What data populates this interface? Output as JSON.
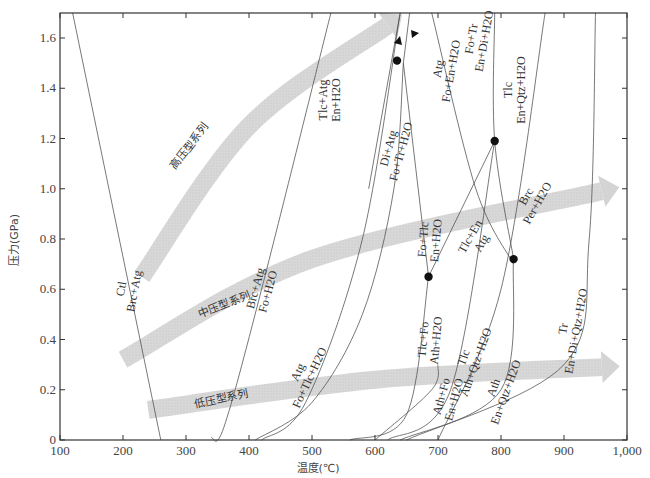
{
  "chart_data": {
    "type": "line",
    "title": "",
    "xlabel": "温度(℃)",
    "ylabel": "压力(GPa)",
    "xlim": [
      100,
      1000
    ],
    "ylim": [
      0,
      1.7
    ],
    "grid": false,
    "x_ticks": [
      100,
      200,
      300,
      400,
      500,
      600,
      700,
      800,
      900,
      1000
    ],
    "x_tick_labels": [
      "100",
      "200",
      "300",
      "400",
      "500",
      "600",
      "700",
      "800",
      "900",
      "1,000"
    ],
    "y_ticks": [
      0,
      0.2,
      0.4,
      0.6,
      0.8,
      1.0,
      1.2,
      1.4,
      1.6
    ],
    "y_tick_labels": [
      "0",
      "0.2",
      "0.4",
      "0.6",
      "0.8",
      "1.0",
      "1.2",
      "1.4",
      "1.6"
    ],
    "reactions": [
      {
        "upper": "Ctl",
        "lower": "Brc+Atg",
        "points": [
          [
            120,
            1.7
          ],
          [
            260,
            0
          ]
        ]
      },
      {
        "upper": "Brc+Atg",
        "lower": "Fo+H2O",
        "points": [
          [
            340,
            0.01
          ],
          [
            360,
            0.05
          ],
          [
            420,
            0.6
          ],
          [
            530,
            1.7
          ]
        ]
      },
      {
        "upper": "Tlc+Atg",
        "lower": "En+H2O",
        "points": [
          [
            640,
            1.7
          ],
          [
            590,
            1.0
          ]
        ]
      },
      {
        "upper": "Di+Atg",
        "lower": "Fo+Tr+H2O",
        "points": [
          [
            420,
            0
          ],
          [
            490,
            0.15
          ],
          [
            580,
            0.8
          ],
          [
            640,
            1.7
          ]
        ]
      },
      {
        "upper": "Atg",
        "lower": "Fo+Tlc+H2O",
        "points": [
          [
            410,
            0
          ],
          [
            500,
            0.15
          ],
          [
            580,
            0.5
          ],
          [
            630,
            1.0
          ],
          [
            645,
            1.5
          ]
        ]
      },
      {
        "upper": "Atg",
        "lower": "Fo+En+H2O",
        "points": [
          [
            645,
            1.5
          ],
          [
            655,
            1.7
          ]
        ]
      },
      {
        "upper": "Fo+Tr",
        "lower": "En+Di+H2O",
        "points": [
          [
            690,
            1.7
          ],
          [
            760,
            1.0
          ],
          [
            820,
            0.7
          ]
        ]
      },
      {
        "upper": "Fo+Tlc",
        "lower": "En+H2O",
        "points": [
          [
            645,
            1.5
          ],
          [
            685,
            0.65
          ]
        ]
      },
      {
        "upper": "Tlc+En",
        "lower": "Atg",
        "points": [
          [
            685,
            0.65
          ],
          [
            790,
            1.19
          ]
        ]
      },
      {
        "upper": "Tlc",
        "lower": "En+Qtz+H2O",
        "points": [
          [
            790,
            1.7
          ],
          [
            790,
            1.19
          ],
          [
            820,
            0.72
          ]
        ]
      },
      {
        "upper": "Brc",
        "lower": "Per+H2O",
        "points": [
          [
            700,
            0
          ],
          [
            800,
            0.6
          ],
          [
            870,
            1.7
          ]
        ]
      },
      {
        "upper": "Tlc+Fo",
        "lower": "Ath+H2O",
        "points": [
          [
            560,
            0
          ],
          [
            650,
            0.1
          ],
          [
            685,
            0.65
          ]
        ]
      },
      {
        "upper": "Ath+Fo",
        "lower": "En+H2O",
        "points": [
          [
            600,
            0
          ],
          [
            690,
            0.2
          ],
          [
            700,
            0.3
          ]
        ]
      },
      {
        "upper": "Tlc",
        "lower": "Ath+Qtz+H2O",
        "points": [
          [
            620,
            0
          ],
          [
            720,
            0.2
          ],
          [
            790,
            1.19
          ]
        ]
      },
      {
        "upper": "Ath",
        "lower": "En+Qtz+H2O",
        "points": [
          [
            640,
            0
          ],
          [
            800,
            0.2
          ],
          [
            820,
            0.72
          ]
        ]
      },
      {
        "upper": "Tr",
        "lower": "En+Di+Qtz+H2O",
        "points": [
          [
            650,
            0
          ],
          [
            900,
            0.3
          ],
          [
            940,
            0.8
          ],
          [
            950,
            1.7
          ]
        ]
      }
    ],
    "invariant_points": [
      [
        635,
        1.51
      ],
      [
        790,
        1.19
      ],
      [
        685,
        0.65
      ],
      [
        820,
        0.72
      ]
    ],
    "series_bands": [
      {
        "name": "高压型系列",
        "description": "high-pressure series arrow",
        "path": [
          [
            230,
            0.65
          ],
          [
            400,
            1.25
          ],
          [
            620,
            1.65
          ]
        ]
      },
      {
        "name": "中压型系列",
        "description": "medium-pressure series arrow",
        "path": [
          [
            200,
            0.32
          ],
          [
            500,
            0.72
          ],
          [
            960,
            0.99
          ]
        ]
      },
      {
        "name": "低压型系列",
        "description": "low-pressure series arrow",
        "path": [
          [
            240,
            0.12
          ],
          [
            600,
            0.24
          ],
          [
            960,
            0.29
          ]
        ]
      }
    ]
  }
}
